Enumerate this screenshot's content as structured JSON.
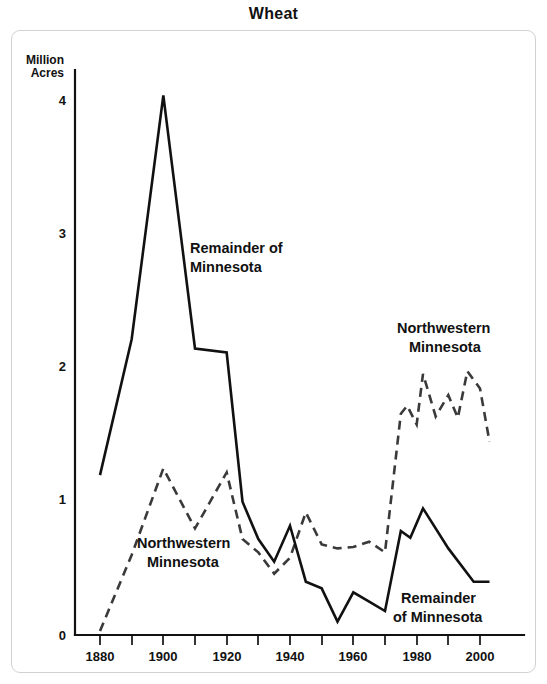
{
  "chart_data": {
    "type": "line",
    "title": "Wheat",
    "xlabel": "",
    "ylabel": "Million Acres",
    "ylabel_line1": "Million",
    "ylabel_line2": "Acres",
    "xlim": [
      1875,
      2005
    ],
    "ylim": [
      0,
      4.25
    ],
    "grid": false,
    "legend": "inline-annotations",
    "y_ticks": [
      "0",
      "1",
      "2",
      "3",
      "4"
    ],
    "y_tick_values": [
      0,
      1,
      2,
      3,
      4
    ],
    "x_ticks": [
      "1880",
      "1900",
      "1920",
      "1940",
      "1960",
      "1980",
      "2000"
    ],
    "x_tick_values": [
      1880,
      1900,
      1920,
      1940,
      1960,
      1980,
      2000
    ],
    "x_minor_tick_values": [
      1880,
      1890,
      1900,
      1910,
      1920,
      1930,
      1940,
      1950,
      1960,
      1970,
      1980,
      1990,
      2000
    ],
    "series": [
      {
        "name": "Remainder of Minnesota",
        "style": "solid",
        "color": "#111111",
        "x": [
          1880,
          1890,
          1900,
          1910,
          1920,
          1925,
          1930,
          1935,
          1940,
          1945,
          1950,
          1955,
          1960,
          1965,
          1970,
          1975,
          1978,
          1982,
          1990,
          1998,
          2003
        ],
        "values": [
          1.2,
          2.22,
          4.05,
          2.15,
          2.12,
          1.0,
          0.72,
          0.55,
          0.82,
          0.4,
          0.35,
          0.1,
          0.32,
          0.25,
          0.18,
          0.78,
          0.73,
          0.95,
          0.65,
          0.4,
          0.4
        ]
      },
      {
        "name": "Northwestern Minnesota",
        "style": "dashed",
        "color": "#3a3a3a",
        "x": [
          1880,
          1890,
          1900,
          1910,
          1920,
          1925,
          1930,
          1935,
          1940,
          1945,
          1950,
          1955,
          1960,
          1965,
          1970,
          1975,
          1977,
          1980,
          1982,
          1986,
          1990,
          1993,
          1996,
          2000,
          2003
        ],
        "values": [
          0.03,
          0.6,
          1.25,
          0.8,
          1.22,
          0.72,
          0.62,
          0.46,
          0.58,
          0.92,
          0.68,
          0.65,
          0.66,
          0.7,
          0.62,
          1.66,
          1.72,
          1.58,
          1.96,
          1.64,
          1.8,
          1.63,
          1.98,
          1.85,
          1.45
        ]
      }
    ],
    "annotations": [
      {
        "text_line1": "Remainder of",
        "text_line2": "Minnesota",
        "series": "Remainder of Minnesota",
        "x_px": 189,
        "y_px": 246
      },
      {
        "text_line1": "Northwestern",
        "text_line2": "Minnesota",
        "series": "Northwestern Minnesota",
        "x_px": 136,
        "y_px": 541
      },
      {
        "text_line1": "Northwestern",
        "text_line2": "Minnesota",
        "series": "Northwestern Minnesota",
        "x_px": 396,
        "y_px": 325
      },
      {
        "text_line1": "Remainder",
        "text_line2": "of Minnesota",
        "series": "Remainder of Minnesota",
        "x_px": 397,
        "y_px": 594
      }
    ]
  }
}
